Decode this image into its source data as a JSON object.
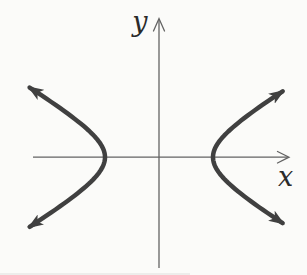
{
  "figure": {
    "type": "function-graph",
    "curve_name": "hyperbola",
    "x_label": "x",
    "y_label": "y",
    "colors": {
      "background": "#fbfbf9",
      "curve": "#404040",
      "axis": "#636363",
      "label": "#2a2a2a"
    },
    "hyperbola": {
      "center_x": 159,
      "center_y": 157.2,
      "a": 54,
      "b": 32,
      "left_t_max": 1.52,
      "right_t_max": 1.47,
      "stroke_width": 4.5,
      "opens": "left-right",
      "branch_count": 2
    }
  }
}
